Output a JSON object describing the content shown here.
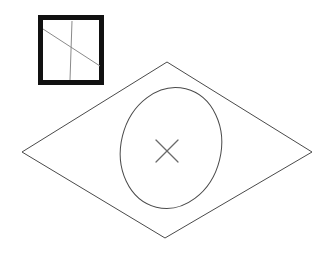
{
  "figure": {
    "canvas": {
      "width": 333,
      "height": 253,
      "background": "#ffffff"
    },
    "stroke_color": "#4a4a4a",
    "stroke_color_dark": "#111111",
    "stroke_color_light": "#8a8a8a",
    "stroke_width_thin": 1,
    "stroke_width_heavy": 5
  },
  "inset_box": {
    "label": "detail inset",
    "x": 38,
    "y": 15,
    "width": 66,
    "height": 70,
    "border_width": 5,
    "border_color": "#111111",
    "fill": "#ffffff",
    "vertical_line": {
      "x1": 72,
      "y1": 21,
      "x2": 70,
      "y2": 80,
      "color": "#8a8a8a",
      "width": 1
    },
    "diagonal_line": {
      "x1": 43,
      "y1": 29,
      "x2": 100,
      "y2": 66,
      "color": "#8a8a8a",
      "width": 1
    }
  },
  "plane": {
    "label": "ground plane quadrilateral",
    "points": "22,152 167,62 312,152 165,238",
    "stroke": "#4a4a4a",
    "stroke_width": 1,
    "fill": "none",
    "vertices": [
      {
        "name": "left",
        "x": 22,
        "y": 152
      },
      {
        "name": "top",
        "x": 167,
        "y": 62
      },
      {
        "name": "right",
        "x": 312,
        "y": 152
      },
      {
        "name": "bottom",
        "x": 165,
        "y": 238
      }
    ]
  },
  "ellipse": {
    "label": "projected circle on plane",
    "cx": 171,
    "cy": 148,
    "rx": 50,
    "ry": 61,
    "rotation_deg": 14,
    "stroke": "#4a4a4a",
    "stroke_width": 1,
    "fill": "none"
  },
  "center_marker": {
    "label": "center cross mark",
    "cx": 167,
    "cy": 151,
    "arm": 11,
    "stroke": "#6a6a6a",
    "stroke_width": 1.2
  }
}
